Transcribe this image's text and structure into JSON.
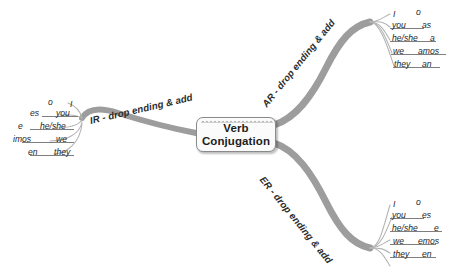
{
  "center": {
    "title_line1": "Verb",
    "title_line2": "Conjugation",
    "fill_color": "#fbfbfb",
    "border_color": "#8a8a8a"
  },
  "colors": {
    "branch_stroke": "#9d9d9d",
    "sub_stroke": "#b4b4b4",
    "text": "#272727",
    "background": "#ffffff"
  },
  "branches": [
    {
      "id": "ir",
      "label": "IR - drop ending & add",
      "direction": "left",
      "rows": [
        {
          "pronoun": "I",
          "ending": "o"
        },
        {
          "pronoun": "you",
          "ending": "es"
        },
        {
          "pronoun": "he/she",
          "ending": "e"
        },
        {
          "pronoun": "we",
          "ending": "imos"
        },
        {
          "pronoun": "they",
          "ending": "en"
        }
      ]
    },
    {
      "id": "ar",
      "label": "AR - drop ending & add",
      "direction": "upper-right",
      "rows": [
        {
          "pronoun": "I",
          "ending": "o"
        },
        {
          "pronoun": "you",
          "ending": "as"
        },
        {
          "pronoun": "he/she",
          "ending": "a"
        },
        {
          "pronoun": "we",
          "ending": "amos"
        },
        {
          "pronoun": "they",
          "ending": "an"
        }
      ]
    },
    {
      "id": "er",
      "label": "ER - drop ending & add",
      "direction": "lower-right",
      "rows": [
        {
          "pronoun": "I",
          "ending": "o"
        },
        {
          "pronoun": "you",
          "ending": "es"
        },
        {
          "pronoun": "he/she",
          "ending": "e"
        },
        {
          "pronoun": "we",
          "ending": "emos"
        },
        {
          "pronoun": "they",
          "ending": "en"
        }
      ]
    }
  ]
}
